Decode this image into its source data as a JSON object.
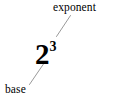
{
  "figure": {
    "background_color": "#ffffff",
    "width": 114,
    "height": 102
  },
  "expression": {
    "base_digit": "2",
    "exponent_digit": "3",
    "full_text": "2³",
    "color": "#000000"
  },
  "annotations": {
    "exponent_label": "exponent",
    "base_label": "base",
    "label_color": "#000000"
  },
  "leader_lines": {
    "color": "#9a9a9a",
    "stroke_width": 1,
    "exponent_line": {
      "x1": 70.5,
      "y1": 15.5,
      "x2": 56.5,
      "y2": 36.5
    },
    "base_line": {
      "x1": 44.5,
      "y1": 62.5,
      "x2": 29.5,
      "y2": 84.5
    }
  }
}
